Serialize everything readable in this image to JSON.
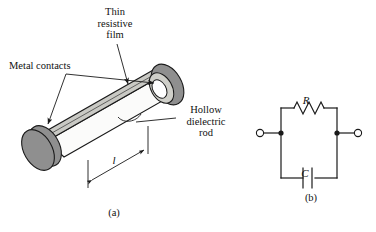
{
  "figure": {
    "panels": [
      {
        "id": "panel-a",
        "caption": "(a)",
        "description": "isometric-hollow-dielectric-rod"
      },
      {
        "id": "panel-b",
        "caption": "(b)",
        "description": "parallel-rc-equivalent-circuit"
      }
    ]
  },
  "panel_a": {
    "labels": {
      "thin_resistive_film": "Thin\nresistive\nfilm",
      "metal_contacts": "Metal contacts",
      "hollow_dielectric_rod": "Hollow\ndielectric\nrod",
      "length_symbol": "l"
    },
    "colors": {
      "metal_contact_fill": "#8f8f8f",
      "resistive_film_fill": "#c9c9c4",
      "rod_body_fill": "#fbfbfa",
      "hollow_interior_fill": "#ffffff",
      "outline": "#1a1a1a"
    }
  },
  "panel_b": {
    "caption": "(b)",
    "components": [
      {
        "name": "resistor",
        "symbol": "R",
        "position": "top-branch"
      },
      {
        "name": "capacitor",
        "symbol": "C",
        "position": "bottom-branch"
      }
    ],
    "terminals": [
      {
        "name": "left-terminal",
        "type": "open-circle"
      },
      {
        "name": "right-terminal",
        "type": "open-circle"
      }
    ],
    "junctions": [
      {
        "name": "left-junction",
        "type": "filled-dot"
      },
      {
        "name": "right-junction",
        "type": "filled-dot"
      }
    ],
    "colors": {
      "wire": "#1a1a1a",
      "terminal_fill": "#ffffff"
    }
  }
}
